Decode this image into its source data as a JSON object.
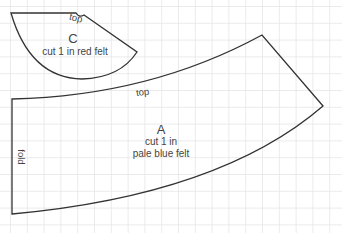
{
  "pieces": {
    "c": {
      "letter": "C",
      "instruction": "cut 1 in red felt",
      "edge_label": "top"
    },
    "a": {
      "letter": "A",
      "instruction_line1": "cut 1 in",
      "instruction_line2": "pale blue felt",
      "edge_label_top": "top",
      "edge_label_fold": "fold"
    }
  },
  "colors": {
    "outline": "#333333",
    "grid": "#e6e6e6",
    "text": "#444444",
    "background": "#ffffff"
  }
}
